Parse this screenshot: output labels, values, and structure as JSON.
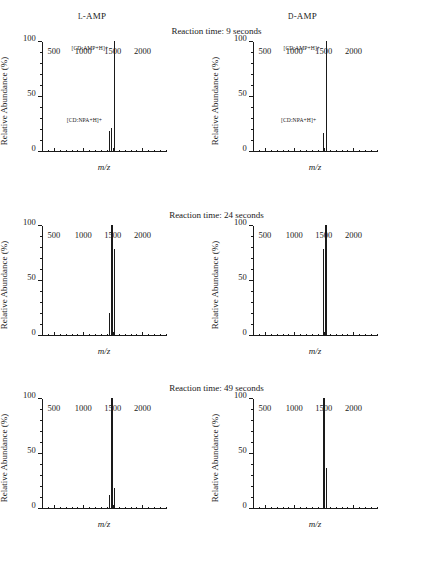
{
  "figure": {
    "columns": [
      {
        "prefix": "L",
        "rest": "-AMP"
      },
      {
        "prefix": "D",
        "rest": "-AMP"
      }
    ],
    "axis": {
      "ylabel": "Relative Abundance (%)",
      "xlabel": "m/z",
      "yticks": [
        "0",
        "50",
        "100"
      ],
      "ytick_values": [
        0,
        50,
        100
      ],
      "ylim": [
        0,
        100
      ],
      "xticks": [
        "500",
        "1000",
        "1500",
        "2000"
      ],
      "xtick_values": [
        500,
        1000,
        1500,
        2000
      ],
      "xlim": [
        300,
        2400
      ]
    },
    "rows": [
      {
        "title": "Reaction time: 9 seconds"
      },
      {
        "title": "Reaction time: 24 seconds"
      },
      {
        "title": "Reaction time: 49 seconds"
      }
    ]
  },
  "chart_data": [
    {
      "type": "bar",
      "panel": "row1-left",
      "title": "Reaction time: 9 seconds",
      "column": "L-AMP",
      "xlabel": "m/z",
      "ylabel": "Relative Abundance (%)",
      "xlim": [
        300,
        2400
      ],
      "ylim": [
        0,
        100
      ],
      "x": [
        1432,
        1468,
        1512
      ],
      "values": [
        18,
        21,
        100
      ],
      "annotations": [
        {
          "text": "[CD:NPA+H]+",
          "x": 1432,
          "y": 26
        },
        {
          "text": "[CD:AMP+H]+",
          "x": 1512,
          "y": 92
        }
      ]
    },
    {
      "type": "bar",
      "panel": "row1-right",
      "title": "Reaction time: 9 seconds",
      "column": "D-AMP",
      "xlabel": "m/z",
      "ylabel": "Relative Abundance (%)",
      "xlim": [
        300,
        2400
      ],
      "ylim": [
        0,
        100
      ],
      "x": [
        1486,
        1528
      ],
      "values": [
        16,
        100
      ],
      "annotations": [
        {
          "text": "[CD:NPA+H]+",
          "x": 1486,
          "y": 26
        },
        {
          "text": "[CD:AMP+H]+",
          "x": 1528,
          "y": 92
        }
      ]
    },
    {
      "type": "bar",
      "panel": "row2-left",
      "title": "Reaction time: 24 seconds",
      "column": "L-AMP",
      "xlabel": "m/z",
      "ylabel": "Relative Abundance (%)",
      "xlim": [
        300,
        2400
      ],
      "ylim": [
        0,
        100
      ],
      "x": [
        1432,
        1472,
        1514
      ],
      "values": [
        20,
        100,
        78
      ],
      "annotations": []
    },
    {
      "type": "bar",
      "panel": "row2-right",
      "title": "Reaction time: 24 seconds",
      "column": "D-AMP",
      "xlabel": "m/z",
      "ylabel": "Relative Abundance (%)",
      "xlim": [
        300,
        2400
      ],
      "ylim": [
        0,
        100
      ],
      "x": [
        1484,
        1524
      ],
      "values": [
        78,
        100
      ],
      "annotations": []
    },
    {
      "type": "bar",
      "panel": "row3-left",
      "title": "Reaction time: 49 seconds",
      "column": "L-AMP",
      "xlabel": "m/z",
      "ylabel": "Relative Abundance (%)",
      "xlim": [
        300,
        2400
      ],
      "ylim": [
        0,
        100
      ],
      "x": [
        1434,
        1472,
        1516
      ],
      "values": [
        12,
        100,
        18
      ],
      "annotations": []
    },
    {
      "type": "bar",
      "panel": "row3-right",
      "title": "Reaction time: 49 seconds",
      "column": "D-AMP",
      "xlabel": "m/z",
      "ylabel": "Relative Abundance (%)",
      "xlim": [
        300,
        2400
      ],
      "ylim": [
        0,
        100
      ],
      "x": [
        1490,
        1528
      ],
      "values": [
        100,
        36
      ],
      "annotations": []
    }
  ]
}
